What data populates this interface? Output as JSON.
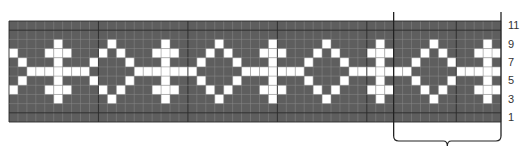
{
  "chart_data": {
    "type": "heatmap",
    "title": "",
    "columns": 55,
    "rows": 11,
    "row_order": "top-to-bottom (row 11 to row 1)",
    "legend": {
      "1": "contrast color (white)",
      "0": "main color (dark gray)"
    },
    "grid": [
      "0000000000000000000000000000000000000000000000000000000",
      "0000000000000000000000000000000000000000000000000000000",
      "0000010000010000010000010000010000010000010000010000010",
      "1000111000101000111000101000111000101000111000101000111",
      "0100010001000100010001000100010001000100010001000100010",
      "0011111110000011111110000011111110000011111110000011111",
      "0100010001000100010001000100010001000100010001000100010",
      "1000111000101000111000101000111000101000111000101000111",
      "0000010000010000010000010000010000010000010000010000010",
      "0000000000000000000000000000000000000000000000000000000",
      "0000000000000000000000000000000000000000000000000000000"
    ],
    "row_labels": [
      "11",
      "9",
      "7",
      "5",
      "3",
      "1"
    ],
    "row_label_rows": [
      11,
      9,
      7,
      5,
      3,
      1
    ],
    "repeat": {
      "start_col": 43,
      "end_col": 55,
      "stitches": 12
    },
    "colors": {
      "dark": "#5e5e5e",
      "light": "#ffffff",
      "gridline": "#3a3a3a",
      "line": "#222222"
    }
  }
}
